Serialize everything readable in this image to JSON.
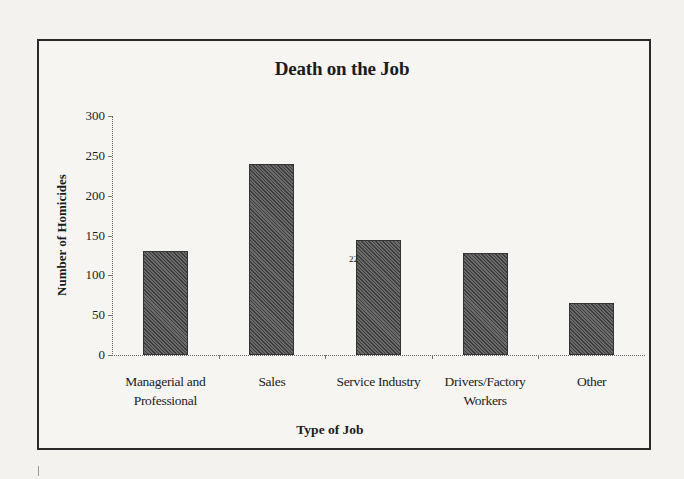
{
  "chart_data": {
    "type": "bar",
    "title": "Death on the Job",
    "xlabel": "Type of Job",
    "ylabel": "Number of Homicides",
    "categories": [
      "Managerial and Professional",
      "Sales",
      "Service Industry",
      "Drivers/Factory Workers",
      "Other"
    ],
    "category_label_lines": [
      [
        "Managerial and",
        "Professional"
      ],
      [
        "Sales"
      ],
      [
        "Service Industry"
      ],
      [
        "Drivers/Factory",
        "Workers"
      ],
      [
        "Other"
      ]
    ],
    "values": [
      131,
      240,
      144,
      128,
      65
    ],
    "ylim": [
      0,
      300
    ],
    "yticks": [
      0,
      50,
      100,
      150,
      200,
      250,
      300
    ],
    "grid": false,
    "legend": "none",
    "bar_color": "#4e4e4e",
    "bar_fill": "diagonal-hatch",
    "annotations": [
      "22"
    ]
  }
}
